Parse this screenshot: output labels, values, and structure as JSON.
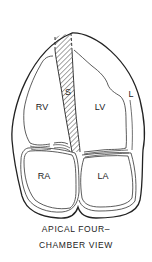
{
  "diagram": {
    "labels": {
      "septum": "S",
      "right_ventricle": "RV",
      "left_ventricle": "LV",
      "lateral_wall": "L",
      "right_atrium": "RA",
      "left_atrium": "LA"
    },
    "caption": {
      "line1": "APICAL FOUR–",
      "line2": "CHAMBER VIEW"
    },
    "colors": {
      "stroke": "#222222",
      "background": "#ffffff"
    }
  }
}
